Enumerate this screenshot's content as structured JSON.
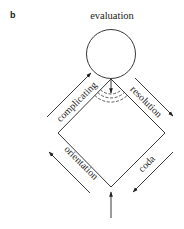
{
  "panel": {
    "label": "b"
  },
  "diagram": {
    "type": "narrative-structure",
    "node": {
      "label": "evaluation",
      "shape": "circle"
    },
    "edges": [
      {
        "label": "complicating",
        "direction": "up-right",
        "position": "upper-left"
      },
      {
        "label": "resolution",
        "direction": "down-right",
        "position": "upper-right"
      },
      {
        "label": "orientation",
        "direction": "up-left",
        "position": "lower-left"
      },
      {
        "label": "coda",
        "direction": "down-left",
        "position": "lower-right"
      }
    ],
    "entry_arrow": {
      "direction": "up",
      "position": "bottom"
    },
    "inner_arrow": {
      "direction": "down",
      "position": "below-evaluation"
    },
    "dashed_arcs": 3,
    "colors": {
      "stroke": "#222222",
      "background": "#ffffff"
    }
  }
}
